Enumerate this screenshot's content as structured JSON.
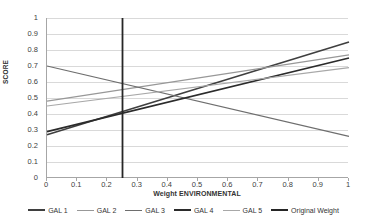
{
  "chart_data": {
    "type": "line",
    "title": "",
    "xlabel": "Weight ENVIRONMENTAL",
    "ylabel": "SCORE",
    "xlim": [
      0,
      1
    ],
    "ylim": [
      0,
      1
    ],
    "grid": true,
    "legend_position": "bottom",
    "x_ticks": [
      "0",
      "0.1",
      "0.2",
      "0.3",
      "0.4",
      "0.5",
      "0.6",
      "0.7",
      "0.8",
      "0.9",
      "1"
    ],
    "x_tick_values": [
      0,
      0.1,
      0.2,
      0.3,
      0.4,
      0.5,
      0.6,
      0.7,
      0.8,
      0.9,
      1
    ],
    "y_ticks": [
      "0",
      "0.1",
      "0.2",
      "0.3",
      "0.4",
      "0.5",
      "0.6",
      "0.7",
      "0.8",
      "0.9",
      "1"
    ],
    "y_tick_values": [
      0,
      0.1,
      0.2,
      0.3,
      0.4,
      0.5,
      0.6,
      0.7,
      0.8,
      0.9,
      1
    ],
    "x": [
      0,
      1
    ],
    "series": [
      {
        "name": "GAL 1",
        "values": [
          0.27,
          0.85
        ],
        "color": "#3f3f3f",
        "width": 1.6
      },
      {
        "name": "GAL 2",
        "values": [
          0.48,
          0.77
        ],
        "color": "#989898",
        "width": 1.2
      },
      {
        "name": "GAL 3",
        "values": [
          0.7,
          0.26
        ],
        "color": "#6e6e6e",
        "width": 1.2
      },
      {
        "name": "GAL 4",
        "values": [
          0.29,
          0.75
        ],
        "color": "#2b2b2b",
        "width": 1.7
      },
      {
        "name": "GAL 5",
        "values": [
          0.45,
          0.69
        ],
        "color": "#a8a8a8",
        "width": 1.2
      }
    ],
    "vertical_marker": {
      "name": "Original Weight",
      "x": 0.25,
      "y_from": 0,
      "y_to": 1,
      "color": "#262626",
      "width": 1.8
    }
  },
  "legend": {
    "items": [
      {
        "label": "GAL 1",
        "color": "#3f3f3f",
        "width": "2px"
      },
      {
        "label": "GAL 2",
        "color": "#989898",
        "width": "1.5px"
      },
      {
        "label": "GAL 3",
        "color": "#6e6e6e",
        "width": "1.5px"
      },
      {
        "label": "GAL 4",
        "color": "#2b2b2b",
        "width": "2.2px"
      },
      {
        "label": "GAL 5",
        "color": "#a8a8a8",
        "width": "1.5px"
      },
      {
        "label": "Original Weight",
        "color": "#262626",
        "width": "2.2px"
      }
    ]
  },
  "axes": {
    "x_title": "Weight ENVIRONMENTAL",
    "y_title": "SCORE"
  }
}
